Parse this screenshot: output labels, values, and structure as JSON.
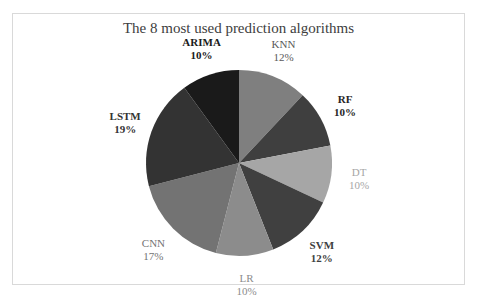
{
  "chart_data": {
    "type": "pie",
    "title": "The 8 most used prediction algorithms",
    "categories": [
      "KNN",
      "RF",
      "DT",
      "SVM",
      "LR",
      "CNN",
      "LSTM",
      "ARIMA"
    ],
    "values": [
      12,
      10,
      10,
      12,
      10,
      17,
      19,
      10
    ],
    "value_labels": [
      "12%",
      "10%",
      "10%",
      "12%",
      "10%",
      "17%",
      "19%",
      "10%"
    ],
    "colors": [
      "#7f7f7f",
      "#3f3f3f",
      "#a6a6a6",
      "#404040",
      "#8c8c8c",
      "#737373",
      "#333333",
      "#1a1a1a"
    ],
    "label_colors": [
      "#595959",
      "#262626",
      "#a6a6a6",
      "#404040",
      "#8c8c8c",
      "#737373",
      "#333333",
      "#1a1a1a"
    ],
    "label_bold": [
      false,
      true,
      false,
      true,
      false,
      false,
      true,
      true
    ],
    "start_angle_deg": 0,
    "direction": "clockwise",
    "legend": "none"
  }
}
